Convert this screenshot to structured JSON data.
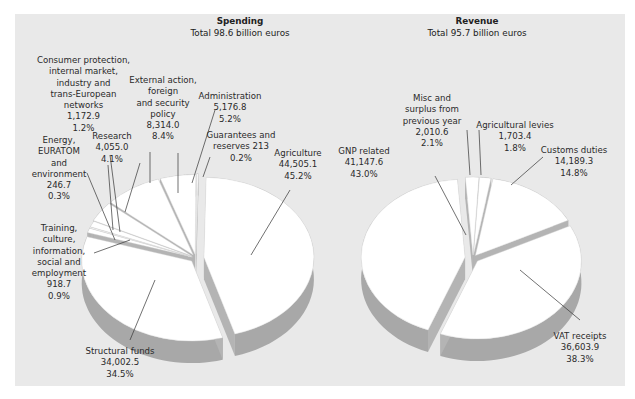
{
  "chart_data": [
    {
      "type": "pie",
      "title": "Spending",
      "subtitle": "Total 98.6 billion euros",
      "unit": "million euros",
      "categories": [
        "Agriculture",
        "Structural funds",
        "Training, culture, information, social and employment",
        "Energy, EURATOM and environment",
        "Consumer protection, internal market, industry and trans-European networks",
        "Research",
        "External action, foreign and security policy",
        "Administration",
        "Guarantees and reserves"
      ],
      "values": [
        44505.1,
        34002.5,
        918.7,
        246.7,
        1172.9,
        4055.0,
        8314.0,
        5176.8,
        213
      ],
      "percentages": [
        45.2,
        34.5,
        0.9,
        0.3,
        1.2,
        4.1,
        8.4,
        5.2,
        0.2
      ],
      "exploded": true,
      "style": "3d"
    },
    {
      "type": "pie",
      "title": "Revenue",
      "subtitle": "Total 95.7 billion euros",
      "unit": "million euros",
      "categories": [
        "Customs duties",
        "VAT receipts",
        "GNP related",
        "Misc and surplus from previous year",
        "Agricultural levies"
      ],
      "values": [
        14189.3,
        36603.9,
        41147.6,
        2010.6,
        1703.4
      ],
      "percentages": [
        14.8,
        38.3,
        43.0,
        2.1,
        1.8
      ],
      "exploded": true,
      "style": "3d"
    }
  ],
  "spending": {
    "title": "Spending",
    "subtitle": "Total 98.6 billion euros",
    "labels": {
      "consumer": "Consumer protection,\ninternal market,\nindustry and\ntrans-European\nnetworks\n1,172.9\n1.2%",
      "external": "External action,\nforeign\nand security\npolicy\n8,314.0\n8.4%",
      "administration": "Administration\n5,176.8\n5.2%",
      "guarantees": "Guarantees and\nreserves 213\n0.2%",
      "research": "Research\n4,055.0\n4.1%",
      "energy": "Energy,\nEURATOM\nand\nenvironment\n246.7\n0.3%",
      "agriculture": "Agriculture\n44,505.1\n45.2%",
      "training": "Training,\nculture,\ninformation,\nsocial and\nemployment\n918.7\n0.9%",
      "structural": "Structural funds\n34,002.5\n34.5%"
    }
  },
  "revenue": {
    "title": "Revenue",
    "subtitle": "Total 95.7 billion euros",
    "labels": {
      "misc": "Misc and\nsurplus from\nprevious year\n2,010.6\n2.1%",
      "levies": "Agricultural levies\n1,703.4\n1.8%",
      "gnp": "GNP related\n41,147.6\n43.0%",
      "customs": "Customs duties\n14,189.3\n14.8%",
      "vat": "VAT receipts\n36,603.9\n38.3%"
    }
  },
  "colors": {
    "panel": "#e9e9e9",
    "slice_top": "#ffffff",
    "slice_side": "#a8a8a8",
    "leader": "#333333"
  }
}
